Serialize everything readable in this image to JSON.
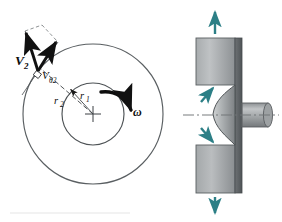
{
  "figure": {
    "background_color": "#ffffff",
    "line_color": "#4d4d4d",
    "vector_color": "#111111",
    "flow_arrow_color": "#2c7f86",
    "metal_light": "#b9bcbe",
    "metal_mid": "#9a9ea1",
    "metal_dark": "#6f7477",
    "metal_edge": "#5a5f62"
  },
  "left_panel": {
    "name": "impeller-front-view",
    "center": {
      "x": 93,
      "y": 114,
      "marker": "cross"
    },
    "outer_circle": {
      "radius": 70,
      "label": "r_2"
    },
    "inner_circle": {
      "radius": 31,
      "label": "r_1"
    },
    "labels": {
      "v2": "V",
      "v2_sub": "2",
      "vtheta2": "V",
      "vtheta2_sub": "θ2",
      "r2": "r",
      "r2_sub": "2",
      "r1": "r",
      "r1_sub": "1",
      "omega": "ω"
    },
    "vectors": [
      {
        "name": "absolute-velocity-V2",
        "label": "V2",
        "style": "solid-bold-arrow"
      },
      {
        "name": "tangential-velocity-Vtheta2",
        "label": "Vθ2",
        "style": "solid-bold-arrow"
      }
    ],
    "construction": {
      "style": "dashed",
      "right_angle_marker": true,
      "tangent_line": true
    },
    "rotation": {
      "label": "ω",
      "direction": "clockwise",
      "style": "curved-bold-arrow"
    }
  },
  "right_panel": {
    "name": "impeller-meridional-section",
    "centerline": {
      "style": "dash-dot",
      "label": "axis"
    },
    "shaft": {
      "name": "drive-shaft",
      "orientation": "horizontal-right"
    },
    "casing_blocks": [
      {
        "name": "upper-casing-block"
      },
      {
        "name": "lower-casing-block"
      }
    ],
    "hub_profile": {
      "name": "curved-hub-profile",
      "style": "filled-gradient"
    },
    "flow_arrows": [
      {
        "name": "inlet-flow-arrow-upper",
        "direction": "up-right"
      },
      {
        "name": "inlet-flow-arrow-lower",
        "direction": "down-right"
      },
      {
        "name": "outlet-flow-arrow-top",
        "direction": "up"
      },
      {
        "name": "outlet-flow-arrow-bottom",
        "direction": "down"
      }
    ]
  }
}
